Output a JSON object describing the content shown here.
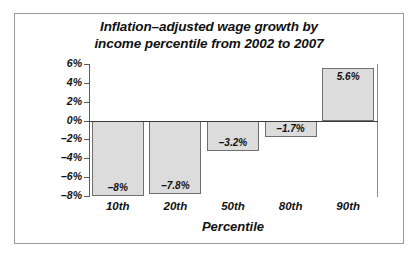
{
  "chart_data": {
    "type": "bar",
    "title": "Inflation–adjusted wage growth by income percentile from 2002 to 2007",
    "title_lines": [
      "Inflation–adjusted wage growth by",
      "income percentile from 2002 to 2007"
    ],
    "categories": [
      "10th",
      "20th",
      "50th",
      "80th",
      "90th"
    ],
    "values": [
      -8,
      -7.8,
      -3.2,
      -1.7,
      5.6
    ],
    "data_labels": [
      "–8%",
      "–7.8%",
      "–3.2%",
      "–1.7%",
      "5.6%"
    ],
    "xlabel": "Percentile",
    "ylabel": "",
    "ylim": [
      -8,
      6
    ],
    "ytick_values": [
      6,
      4,
      2,
      0,
      -2,
      -4,
      -6,
      -8
    ],
    "ytick_labels": [
      "6%",
      "4%",
      "2%",
      "0%",
      "–2%",
      "–4%",
      "–6%",
      "–8%"
    ],
    "grid": false,
    "legend": false,
    "bar_fill_color": "#dcdcdc",
    "bar_border_color": "#6e6e6e",
    "axis_color": "#5a5a5a",
    "frame_color": "#9a9a9a",
    "text_color": "#111111"
  }
}
